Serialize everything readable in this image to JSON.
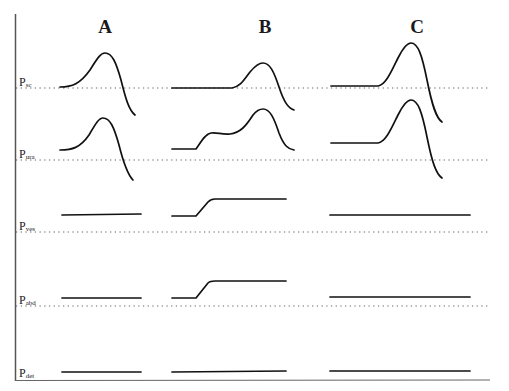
{
  "figure": {
    "columns": [
      {
        "label": "A",
        "x": 105
      },
      {
        "label": "B",
        "x": 265
      },
      {
        "label": "C",
        "x": 417
      }
    ],
    "rows": [
      {
        "label_main": "P",
        "label_sub": "sc",
        "baseline_y": 88,
        "label_y": 76
      },
      {
        "label_main": "P",
        "label_sub": "ura",
        "baseline_y": 160,
        "label_y": 148
      },
      {
        "label_main": "P",
        "label_sub": "ves",
        "baseline_y": 232,
        "label_y": 220
      },
      {
        "label_main": "P",
        "label_sub": "abd",
        "baseline_y": 306,
        "label_y": 294
      },
      {
        "label_main": "P",
        "label_sub": "det",
        "baseline_y": 380,
        "label_y": 367
      }
    ],
    "colors": {
      "trace": "#111111",
      "axis": "#555555",
      "dotted": "#666666",
      "background": "#ffffff"
    }
  },
  "chart_data": {
    "type": "line",
    "title": "",
    "columns": [
      "A",
      "B",
      "C"
    ],
    "rows": [
      "Psc",
      "Pura",
      "Pves",
      "Pabd",
      "Pdet"
    ],
    "traces": {
      "A": {
        "Psc": "single peak rising from baseline, peaks then falls below baseline",
        "Pura": "single peak rising from baseline, peaks then falls below baseline",
        "Pves": "flat",
        "Pabd": "flat",
        "Pdet": "flat"
      },
      "B": {
        "Psc": "long flat segment then delayed single peak",
        "Pura": "step rise with shoulder, then larger peak",
        "Pves": "step rise then plateau",
        "Pabd": "step rise then plateau",
        "Pdet": "flat"
      },
      "C": {
        "Psc": "flat then sharp tall peak, falls well below baseline",
        "Pura": "elevated flat then sharp tall peak, falls well below baseline",
        "Pves": "flat",
        "Pabd": "flat",
        "Pdet": "flat"
      }
    },
    "paths": {
      "A_Psc": "M60 87 C72 87 80 84 90 70 C98 57 101 53 105 53 C112 53 116 62 121 80 C126 100 129 110 135 115",
      "A_Pura": "M60 150 C72 150 80 148 89 135 C96 123 99 118 103 118 C110 118 114 127 119 145 C124 165 128 175 133 180",
      "A_Pves": "M62 215 L141 214",
      "A_Pabd": "M62 298 L141 298",
      "A_Pdet": "M62 372 L141 372",
      "B_Psc": "M172 88 L232 88 C240 87 244 80 250 72 C255 66 259 63 263 63 C270 63 274 72 279 87 C284 102 288 108 294 110",
      "B_Pura": "M172 149 L196 149 C201 142 205 134 211 133 C217 132 222 135 230 134 C240 133 246 126 253 115 C257 110 260 109 263 109 C270 109 274 118 279 133 C284 146 288 149 294 150",
      "B_Pves": "M172 216 L196 216 L208 202 C210 200 212 199 215 199 L286 199",
      "B_Pabd": "M172 298 L196 298 L208 283 C210 281 212 281 215 281 L286 281",
      "B_Pdet": "M172 372 L286 371",
      "C_Psc": "M331 86 L378 86 C386 85 392 70 398 58 C403 48 407 43 411 43 C418 43 422 55 427 80 C432 105 436 118 442 122",
      "C_Pura": "M331 143 L378 143 C386 142 392 127 398 115 C403 105 407 100 411 100 C418 100 422 112 427 137 C432 162 436 174 442 178",
      "C_Pves": "M330 215 L470 215",
      "C_Pabd": "M330 297 L470 297",
      "C_Pdet": "M330 371 L470 371"
    },
    "grid": false,
    "legend": null
  }
}
